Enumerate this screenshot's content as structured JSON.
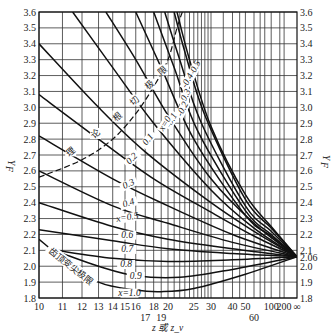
{
  "chart_data": {
    "type": "line",
    "title": "",
    "xlabel": "z 或 z_v",
    "ylabel": "Y_F",
    "x_scale": "reciprocal (1/z), z from 10 to ∞",
    "ylim": [
      1.8,
      3.6
    ],
    "y_ticks": [
      "3.6",
      "3.5",
      "3.4",
      "3.3",
      "3.2",
      "3.1",
      "3.0",
      "2.9",
      "2.8",
      "2.7",
      "2.6",
      "2.5",
      "2.4",
      "2.3",
      "2.2",
      "2.1",
      "2.0",
      "1.9",
      "1.8"
    ],
    "right_extra_tick": "2.06",
    "x_tick_labels": [
      {
        "z": 10,
        "label": "10",
        "row": 0
      },
      {
        "z": 11,
        "label": "11",
        "row": 0
      },
      {
        "z": 12,
        "label": "12",
        "row": 0
      },
      {
        "z": 13,
        "label": "13",
        "row": 0
      },
      {
        "z": 14,
        "label": "14",
        "row": 0
      },
      {
        "z": 15,
        "label": "15",
        "row": 0
      },
      {
        "z": 16,
        "label": "16",
        "row": 0
      },
      {
        "z": 17,
        "label": "17",
        "row": 1
      },
      {
        "z": 18,
        "label": "18",
        "row": 0
      },
      {
        "z": 19,
        "label": "19",
        "row": 1
      },
      {
        "z": 20,
        "label": "20",
        "row": 0
      },
      {
        "z": 25,
        "label": "25",
        "row": 0
      },
      {
        "z": 30,
        "label": "30",
        "row": 0
      },
      {
        "z": 40,
        "label": "40",
        "row": 0
      },
      {
        "z": 50,
        "label": "50",
        "row": 0
      },
      {
        "z": 60,
        "label": "60",
        "row": 1
      },
      {
        "z": 100,
        "label": "100",
        "row": 0
      },
      {
        "z": 200,
        "label": "200",
        "row": 0
      },
      {
        "z": "inf",
        "label": "∞",
        "row": 0
      }
    ],
    "grid_z": [
      10,
      11,
      12,
      13,
      14,
      15,
      16,
      17,
      18,
      19,
      20,
      21,
      22,
      23,
      24,
      25,
      26,
      27,
      28,
      29,
      30,
      35,
      40,
      45,
      50,
      60,
      70,
      80,
      100,
      150,
      200
    ],
    "grid": true,
    "convergence": {
      "z": "inf",
      "Y_F": 2.06
    },
    "series": [
      {
        "name": "x=-0.5",
        "label": "x=-0.5",
        "points": [
          [
            21.5,
            3.6
          ],
          [
            24,
            3.3
          ],
          [
            30,
            2.88
          ],
          [
            50,
            2.45
          ],
          [
            100,
            2.25
          ],
          [
            "inf",
            2.06
          ]
        ]
      },
      {
        "name": "x=-0.4",
        "label": "-0.4",
        "points": [
          [
            21,
            3.6
          ],
          [
            23,
            3.35
          ],
          [
            28,
            2.95
          ],
          [
            50,
            2.42
          ],
          [
            100,
            2.24
          ],
          [
            "inf",
            2.06
          ]
        ]
      },
      {
        "name": "x=-0.3",
        "label": "-0.3",
        "points": [
          [
            19.5,
            3.6
          ],
          [
            22,
            3.3
          ],
          [
            27,
            2.9
          ],
          [
            50,
            2.38
          ],
          [
            100,
            2.22
          ],
          [
            "inf",
            2.06
          ]
        ]
      },
      {
        "name": "x=-0.2",
        "label": "-0.2",
        "points": [
          [
            18,
            3.6
          ],
          [
            21,
            3.25
          ],
          [
            26,
            2.85
          ],
          [
            50,
            2.35
          ],
          [
            100,
            2.2
          ],
          [
            "inf",
            2.06
          ]
        ]
      },
      {
        "name": "x=-0.1",
        "label": "-0.1",
        "points": [
          [
            16,
            3.6
          ],
          [
            19,
            3.25
          ],
          [
            25,
            2.8
          ],
          [
            50,
            2.32
          ],
          [
            100,
            2.19
          ],
          [
            "inf",
            2.06
          ]
        ]
      },
      {
        "name": "x=0",
        "label": "x=0",
        "points": [
          [
            13.5,
            3.6
          ],
          [
            16,
            3.3
          ],
          [
            20,
            2.95
          ],
          [
            30,
            2.55
          ],
          [
            60,
            2.27
          ],
          [
            "inf",
            2.06
          ]
        ]
      },
      {
        "name": "x=0.1",
        "label": "0.1",
        "points": [
          [
            11.5,
            3.6
          ],
          [
            14,
            3.25
          ],
          [
            18,
            2.9
          ],
          [
            30,
            2.48
          ],
          [
            60,
            2.24
          ],
          [
            "inf",
            2.06
          ]
        ]
      },
      {
        "name": "x=0.2",
        "label": "0.2",
        "points": [
          [
            10,
            3.4
          ],
          [
            13,
            3.0
          ],
          [
            17,
            2.72
          ],
          [
            30,
            2.4
          ],
          [
            60,
            2.22
          ],
          [
            "inf",
            2.06
          ]
        ]
      },
      {
        "name": "x=0.3",
        "label": "0.3",
        "points": [
          [
            10,
            3.08
          ],
          [
            13,
            2.8
          ],
          [
            18,
            2.55
          ],
          [
            30,
            2.34
          ],
          [
            60,
            2.19
          ],
          [
            "inf",
            2.06
          ]
        ]
      },
      {
        "name": "x=0.4",
        "label": "0.4",
        "points": [
          [
            10,
            2.82
          ],
          [
            14,
            2.55
          ],
          [
            20,
            2.38
          ],
          [
            40,
            2.2
          ],
          [
            "inf",
            2.06
          ]
        ]
      },
      {
        "name": "x=0.5",
        "label": "x=0.5",
        "points": [
          [
            10,
            2.6
          ],
          [
            14,
            2.38
          ],
          [
            20,
            2.27
          ],
          [
            40,
            2.15
          ],
          [
            "inf",
            2.06
          ]
        ]
      },
      {
        "name": "x=0.6",
        "label": "0.6",
        "points": [
          [
            10,
            2.4
          ],
          [
            14,
            2.25
          ],
          [
            20,
            2.17
          ],
          [
            40,
            2.11
          ],
          [
            "inf",
            2.06
          ]
        ]
      },
      {
        "name": "x=0.7",
        "label": "0.7",
        "points": [
          [
            10,
            2.23
          ],
          [
            14,
            2.16
          ],
          [
            20,
            2.11
          ],
          [
            40,
            2.08
          ],
          [
            "inf",
            2.06
          ]
        ]
      },
      {
        "name": "x=0.8",
        "label": "0.8",
        "points": [
          [
            10.7,
            2.1
          ],
          [
            14,
            2.05
          ],
          [
            20,
            2.03
          ],
          [
            40,
            2.04
          ],
          [
            "inf",
            2.06
          ]
        ]
      },
      {
        "name": "x=0.9",
        "label": "0.9",
        "points": [
          [
            11,
            2.08
          ],
          [
            13,
            2.0
          ],
          [
            16,
            1.94
          ],
          [
            22,
            1.93
          ],
          [
            40,
            1.98
          ],
          [
            "inf",
            2.06
          ]
        ]
      },
      {
        "name": "x=1.0",
        "label": "x=1.0",
        "points": [
          [
            10,
            2.17
          ],
          [
            11,
            2.05
          ],
          [
            13,
            1.9
          ],
          [
            16,
            1.85
          ],
          [
            19,
            1.84
          ],
          [
            25,
            1.86
          ],
          [
            50,
            1.95
          ],
          [
            "inf",
            2.06
          ]
        ]
      }
    ],
    "boundary_curves": [
      {
        "name": "理论根切极限",
        "label": "理 论 根 切 极 限",
        "style": "dashed-to-solid",
        "points": [
          [
            10,
            2.56
          ],
          [
            12,
            2.67
          ],
          [
            14,
            2.8
          ],
          [
            16,
            2.96
          ],
          [
            18,
            3.13
          ],
          [
            20,
            3.3
          ],
          [
            21.5,
            3.5
          ],
          [
            22.5,
            3.6
          ]
        ]
      },
      {
        "name": "齿顶变尖极限",
        "label": "齿顶变尖极限",
        "style": "solid",
        "points": [
          [
            10,
            2.17
          ],
          [
            11,
            2.05
          ],
          [
            12,
            1.95
          ],
          [
            13,
            1.88
          ],
          [
            14,
            1.85
          ]
        ]
      }
    ]
  }
}
